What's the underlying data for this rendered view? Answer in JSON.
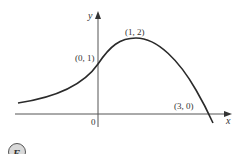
{
  "diagram": {
    "type": "function-graph",
    "axes": {
      "x_label": "x",
      "y_label": "y",
      "origin_label": "0"
    },
    "points": [
      {
        "label": "(0, 1)",
        "x": 0,
        "y": 1,
        "role": "y-intercept"
      },
      {
        "label": "(1, 2)",
        "x": 1,
        "y": 2,
        "role": "local maximum"
      },
      {
        "label": "(3, 0)",
        "x": 3,
        "y": 0,
        "role": "x-intercept"
      }
    ],
    "curve_description": "Increases from a horizontal asymptote near y=0 on the left, passes through (0,1), peaks at (1,2), then decreases crossing the x-axis at (3,0).",
    "badge": "E",
    "colors": {
      "curve": "#2a2a2a",
      "axes": "#555555",
      "text": "#333333",
      "badge_fill": "#d9d9d9",
      "badge_stroke": "#555555"
    }
  }
}
